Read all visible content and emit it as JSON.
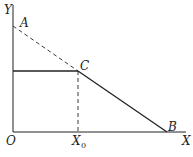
{
  "diagram": {
    "axes": {
      "y_label": "Y",
      "x_label": "X",
      "origin_label": "O"
    },
    "points": {
      "A": {
        "label": "A"
      },
      "B": {
        "label": "B"
      },
      "C": {
        "label": "C"
      }
    },
    "x0": {
      "label": "X",
      "subscript": "0"
    },
    "colors": {
      "line": "#222222",
      "background": "#ffffff"
    }
  }
}
